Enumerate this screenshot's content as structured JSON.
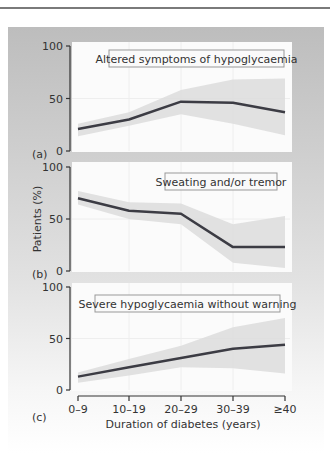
{
  "chart_data": {
    "type": "line",
    "ylabel": "Patients (%)",
    "xlabel": "Duration of diabetes (years)",
    "categories": [
      "0–9",
      "10–19",
      "20–29",
      "30–39",
      "≥40"
    ],
    "ylim": [
      0,
      100
    ],
    "yticks": [
      "0",
      "50",
      "100"
    ],
    "panels": [
      {
        "label": "(a)",
        "title": "Altered symptoms of hypoglycaemia",
        "values": [
          21,
          30,
          47,
          46,
          37
        ],
        "ci_upper": [
          26,
          37,
          58,
          68,
          69
        ],
        "ci_lower": [
          14,
          24,
          35,
          26,
          15
        ]
      },
      {
        "label": "(b)",
        "title": "Sweating and/or tremor",
        "values": [
          70,
          58,
          55,
          23,
          23
        ],
        "ci_upper": [
          77,
          66,
          65,
          45,
          53
        ],
        "ci_lower": [
          64,
          50,
          45,
          8,
          3
        ]
      },
      {
        "label": "(c)",
        "title": "Severe hypoglycaemia without warning",
        "values": [
          13,
          22,
          31,
          40,
          44
        ],
        "ci_upper": [
          17,
          30,
          43,
          61,
          70
        ],
        "ci_lower": [
          7,
          14,
          22,
          21,
          16
        ]
      }
    ]
  }
}
